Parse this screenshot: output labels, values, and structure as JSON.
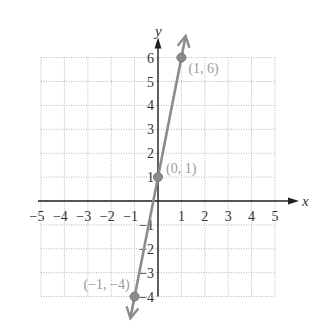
{
  "chart_data": {
    "type": "line",
    "title": "",
    "xlabel": "x",
    "ylabel": "y",
    "xlim": [
      -5,
      5
    ],
    "ylim": [
      -4,
      6
    ],
    "grid": true,
    "x_ticks": [
      -5,
      -4,
      -3,
      -2,
      -1,
      1,
      2,
      3,
      4,
      5
    ],
    "y_ticks": [
      -4,
      -3,
      -2,
      -1,
      1,
      2,
      3,
      4,
      5,
      6
    ],
    "x_tick_labels": [
      "−5",
      "−4",
      "−3",
      "−2",
      "−1",
      "1",
      "2",
      "3",
      "4",
      "5"
    ],
    "y_tick_labels": [
      "−4",
      "−3",
      "−2",
      "−1",
      "1",
      "2",
      "3",
      "4",
      "5",
      "6"
    ],
    "series": [
      {
        "name": "y = 5x + 1",
        "color": "#8c8c8c",
        "points": [
          {
            "x": -1,
            "y": -4,
            "label": "(−1, −4)"
          },
          {
            "x": 0,
            "y": 1,
            "label": "(0, 1)"
          },
          {
            "x": 1,
            "y": 6,
            "label": "(1, 6)"
          }
        ],
        "arrows_both_ends": true
      }
    ]
  },
  "colors": {
    "axis": "#222222",
    "grid": "#b5b5b5",
    "line": "#8c8c8c",
    "point_label": "#9a9a9a"
  }
}
